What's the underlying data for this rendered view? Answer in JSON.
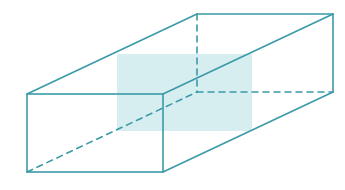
{
  "diagram": {
    "type": "rectangular-prism-wireframe",
    "colors": {
      "edge": "#3a9aa8",
      "shade": "#d6eef0",
      "background": "#ffffff"
    },
    "vertices": {
      "front_top_left": [
        27,
        94
      ],
      "front_top_right": [
        163,
        94
      ],
      "front_bottom_left": [
        27,
        172
      ],
      "front_bottom_right": [
        163,
        172
      ],
      "back_top_left": [
        197,
        14
      ],
      "back_top_right": [
        333,
        14
      ],
      "back_bottom_left": [
        197,
        92
      ],
      "back_bottom_right": [
        333,
        92
      ]
    },
    "shaded_plane": {
      "x": 117,
      "y": 54,
      "width": 135,
      "height": 77
    }
  }
}
